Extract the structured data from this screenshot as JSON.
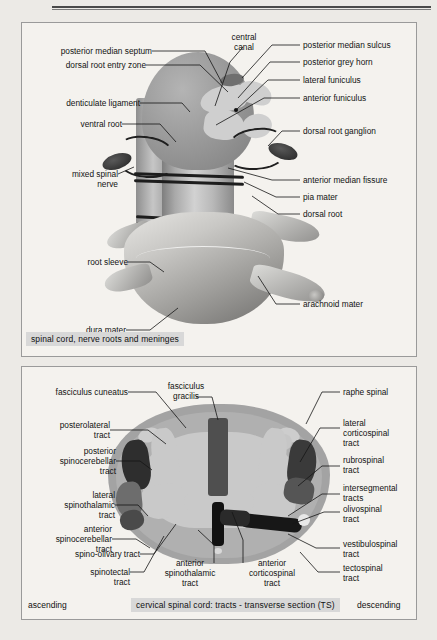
{
  "page": {
    "background_color": "#eceae6",
    "panel_background": "#f4f2ee",
    "panel_border_color": "#9a9a9a",
    "caption_background": "#d8d8d8",
    "text_color": "#121212"
  },
  "panel_top": {
    "caption": "spinal cord, nerve roots and meninges",
    "labels_left": [
      {
        "id": "posterior-median-septum",
        "text": "posterior median septum"
      },
      {
        "id": "dorsal-root-entry-zone",
        "text": "dorsal root entry zone"
      },
      {
        "id": "denticulate-ligament",
        "text": "denticulate ligament"
      },
      {
        "id": "ventral-root",
        "text": "ventral root"
      },
      {
        "id": "mixed-spinal-nerve",
        "text": "mixed spinal\nnerve"
      },
      {
        "id": "root-sleeve",
        "text": "root sleeve"
      },
      {
        "id": "dura-mater",
        "text": "dura mater"
      }
    ],
    "labels_top": [
      {
        "id": "central-canal",
        "text": "central\ncanal"
      }
    ],
    "labels_right": [
      {
        "id": "posterior-median-sulcus",
        "text": "posterior median sulcus"
      },
      {
        "id": "posterior-grey-horn",
        "text": "posterior grey horn"
      },
      {
        "id": "lateral-funiculus",
        "text": "lateral funiculus"
      },
      {
        "id": "anterior-funiculus",
        "text": "anterior funiculus"
      },
      {
        "id": "dorsal-root-ganglion",
        "text": "dorsal root ganglion"
      },
      {
        "id": "anterior-median-fissure",
        "text": "anterior median fissure"
      },
      {
        "id": "pia-mater",
        "text": "pia mater"
      },
      {
        "id": "dorsal-root",
        "text": "dorsal root"
      },
      {
        "id": "arachnoid-mater",
        "text": "arachnoid mater"
      }
    ]
  },
  "panel_bottom": {
    "caption": "cervical  spinal cord: tracts - transverse section (TS)",
    "side_left": "ascending",
    "side_right": "descending",
    "labels_top": [
      {
        "id": "fasciculus-gracilis",
        "text": "fasciculus\ngracilis"
      }
    ],
    "labels_left": [
      {
        "id": "fasciculus-cuneatus",
        "text": "fasciculus cuneatus"
      },
      {
        "id": "posterolateral-tract",
        "text": "posterolateral\ntract"
      },
      {
        "id": "posterior-spinocerebellar-tract",
        "text": "posterior\nspinocerebellar\ntract"
      },
      {
        "id": "lateral-spinothalamic-tract",
        "text": "lateral\nspinothalamic\ntract"
      },
      {
        "id": "anterior-spinocerebellar-tract",
        "text": "anterior\nspinocerebellar\ntract"
      },
      {
        "id": "spino-olivary-tract",
        "text": "spino-olivary tract"
      },
      {
        "id": "spinotectal-tract",
        "text": "spinotectal\ntract"
      }
    ],
    "labels_center": [
      {
        "id": "anterior-spinothalamic-tract",
        "text": "anterior\nspinothalamic\ntract"
      },
      {
        "id": "anterior-corticospinal-tract",
        "text": "anterior\ncorticospinal\ntract"
      }
    ],
    "labels_right": [
      {
        "id": "raphe-spinal",
        "text": "raphe spinal"
      },
      {
        "id": "lateral-corticospinal-tract",
        "text": "lateral\ncorticospinal\ntract"
      },
      {
        "id": "rubrospinal-tract",
        "text": "rubrospinal\ntract"
      },
      {
        "id": "intersegmental-tracts",
        "text": "intersegmental\ntracts"
      },
      {
        "id": "olivospinal-tract",
        "text": "olivospinal\ntract"
      },
      {
        "id": "vestibulospinal-tract",
        "text": "vestibulospinal\ntract"
      },
      {
        "id": "tectospinal-tract",
        "text": "tectospinal\ntract"
      }
    ]
  }
}
